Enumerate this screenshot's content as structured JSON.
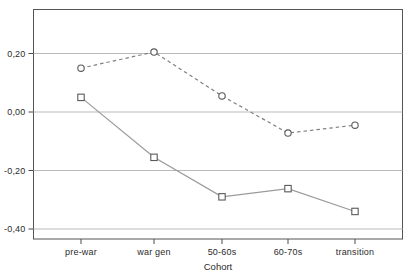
{
  "chart_data": {
    "type": "line",
    "title": "",
    "xlabel": "Cohort",
    "ylabel": "",
    "categories": [
      "pre-war",
      "war gen",
      "50-60s",
      "60-70s",
      "transition"
    ],
    "series": [
      {
        "name": "dashed-circle-series",
        "marker": "circle",
        "linestyle": "dashed",
        "color": "#808080",
        "values": [
          0.15,
          0.205,
          0.055,
          -0.072,
          -0.045
        ]
      },
      {
        "name": "solid-square-series",
        "marker": "square",
        "linestyle": "solid",
        "color": "#9a9a9a",
        "values": [
          0.05,
          -0.155,
          -0.29,
          -0.262,
          -0.34
        ]
      }
    ],
    "ylim": [
      -0.47,
      0.32
    ],
    "yticks": [
      0.2,
      0.0,
      -0.2,
      -0.4
    ],
    "ytick_labels": [
      "0,20",
      "0,00",
      "-0,20",
      "-0,40"
    ],
    "grid": "horizontal",
    "legend": "none",
    "axis_color": "#4a4a4a",
    "grid_color": "#b9b9b9",
    "marker_edge_color": "#5a5a5a",
    "marker_fill_color": "#ffffff",
    "background": "#ffffff"
  }
}
